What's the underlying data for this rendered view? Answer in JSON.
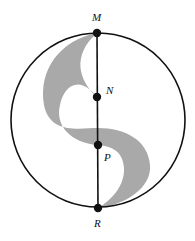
{
  "diagram": {
    "type": "geometry-figure",
    "colors": {
      "stroke": "#111111",
      "shade": "#a9a9a9",
      "background": "#ffffff"
    },
    "points": [
      {
        "id": "M",
        "label": "M"
      },
      {
        "id": "N",
        "label": "N"
      },
      {
        "id": "P",
        "label": "P"
      },
      {
        "id": "R",
        "label": "R"
      }
    ]
  }
}
